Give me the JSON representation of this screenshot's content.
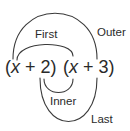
{
  "diagram": {
    "factors": [
      {
        "open": "(",
        "variable": "x",
        "operator": " + ",
        "constant": "2",
        "close": ")"
      },
      {
        "open": "(",
        "variable": "x",
        "operator": " + ",
        "constant": "3",
        "close": ")"
      }
    ],
    "labels": {
      "outer": "Outer",
      "first": "First",
      "inner": "Inner",
      "last": "Last"
    },
    "colors": {
      "stroke": "#3a3a3a",
      "text": "#2a2a2a",
      "background": "#ffffff"
    }
  }
}
